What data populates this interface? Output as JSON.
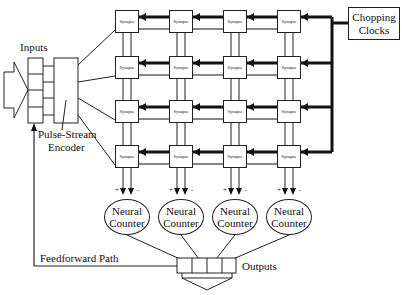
{
  "diagram": {
    "inputs_label": "Inputs",
    "encoder_label_line1": "Pulse-Stream",
    "encoder_label_line2": "Encoder",
    "clock_label_line1": "Chopping",
    "clock_label_line2": "Clocks",
    "feedforward_label": "Feedforward Path",
    "outputs_label": "Outputs",
    "synapse_label": "Synapse",
    "synapse_grid": {
      "rows": 4,
      "cols": 4
    },
    "synapses": [
      [
        "Synapse",
        "Synapse",
        "Synapse",
        "Synapse"
      ],
      [
        "Synapse",
        "Synapse",
        "Synapse",
        "Synapse"
      ],
      [
        "Synapse",
        "Synapse",
        "Synapse",
        "Synapse"
      ],
      [
        "Synapse",
        "Synapse",
        "Synapse",
        "Synapse"
      ]
    ],
    "counters": [
      {
        "line1": "Neural",
        "line2": "Counter",
        "plus": "+",
        "minus": "-"
      },
      {
        "line1": "Neural",
        "line2": "Counter",
        "plus": "+",
        "minus": "-"
      },
      {
        "line1": "Neural",
        "line2": "Counter",
        "plus": "+",
        "minus": "-"
      },
      {
        "line1": "Neural",
        "line2": "Counter",
        "plus": "+",
        "minus": "-"
      }
    ]
  }
}
